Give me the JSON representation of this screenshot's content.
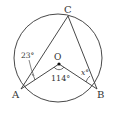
{
  "diagram": {
    "type": "circle-inscribed-angles",
    "circle": {
      "cx": 58,
      "cy": 58,
      "r": 44
    },
    "points": {
      "A": {
        "label": "A",
        "x": 21,
        "y": 89
      },
      "B": {
        "label": "B",
        "x": 97,
        "y": 89
      },
      "C": {
        "label": "C",
        "x": 68,
        "y": 16
      },
      "O": {
        "label": "O",
        "x": 59,
        "y": 64
      }
    },
    "angles": {
      "CAO": {
        "label": "23°"
      },
      "AOB": {
        "label": "114°"
      },
      "OBC": {
        "label": "x°"
      }
    },
    "colors": {
      "stroke": "#333333",
      "background": "#ffffff"
    }
  }
}
